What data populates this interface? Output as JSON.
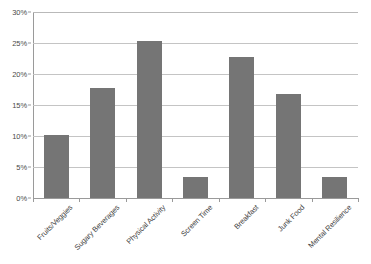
{
  "chart_data": {
    "type": "bar",
    "title": "",
    "xlabel": "",
    "ylabel": "",
    "ylim": [
      0,
      30
    ],
    "ytick_labels": [
      "0%",
      "5%",
      "10%",
      "15%",
      "20%",
      "25%",
      "30%"
    ],
    "ytick_values": [
      0,
      5,
      10,
      15,
      20,
      25,
      30
    ],
    "grid": true,
    "legend": false,
    "value_suffix": "%",
    "bar_color": "#757575",
    "gridline_color": "#c4c4c4",
    "axis_color": "#9a9a9a",
    "categories": [
      "Fruits/Veggies",
      "Sugary Beverages",
      "Physical Activity",
      "Screen Time",
      "Breakfast",
      "Junk Food",
      "Mental Resilience"
    ],
    "values": [
      10.2,
      17.7,
      25.4,
      3.4,
      22.8,
      16.8,
      3.4
    ],
    "series": [
      {
        "name": "Series 1",
        "values": [
          10.2,
          17.7,
          25.4,
          3.4,
          22.8,
          16.8,
          3.4
        ]
      }
    ]
  }
}
